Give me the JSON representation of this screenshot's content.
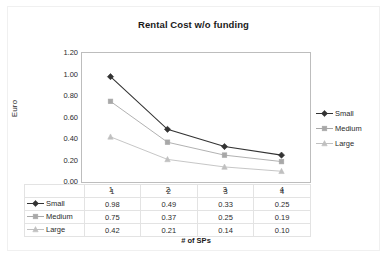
{
  "chart_data": {
    "type": "line",
    "title": "Rental Cost w/o funding",
    "xlabel": "# of SPs",
    "ylabel": "Euro",
    "categories": [
      "1",
      "2",
      "3",
      "4"
    ],
    "series": [
      {
        "name": "Small",
        "values": [
          0.98,
          0.49,
          0.33,
          0.25
        ],
        "color": "#333333",
        "marker": "diamond"
      },
      {
        "name": "Medium",
        "values": [
          0.75,
          0.37,
          0.25,
          0.19
        ],
        "color": "#a8a8a8",
        "marker": "square"
      },
      {
        "name": "Large",
        "values": [
          0.42,
          0.21,
          0.14,
          0.1
        ],
        "color": "#c0c0c0",
        "marker": "triangle"
      }
    ],
    "ylim": [
      0.0,
      1.2
    ],
    "ytick_labels": [
      "1.20",
      "1.00",
      "0.80",
      "0.60",
      "0.40",
      "0.20",
      "0.00"
    ],
    "ytick_values": [
      1.2,
      1.0,
      0.8,
      0.6,
      0.4,
      0.2,
      0.0
    ],
    "grid": false,
    "legend_position": "right",
    "data_table_visible": true
  },
  "table": {
    "rows": [
      {
        "label": "Small",
        "cells": [
          "0.98",
          "0.49",
          "0.33",
          "0.25"
        ]
      },
      {
        "label": "Medium",
        "cells": [
          "0.75",
          "0.37",
          "0.25",
          "0.19"
        ]
      },
      {
        "label": "Large",
        "cells": [
          "0.42",
          "0.21",
          "0.14",
          "0.10"
        ]
      }
    ],
    "header": [
      "1",
      "2",
      "3",
      "4"
    ]
  },
  "colors": {
    "small": "#333333",
    "medium": "#a8a8a8",
    "large": "#c0c0c0",
    "plot_border": "#bdbdbd",
    "table_border": "#e3e3e3",
    "text": "#2b2b2b",
    "background": "#ffffff"
  }
}
